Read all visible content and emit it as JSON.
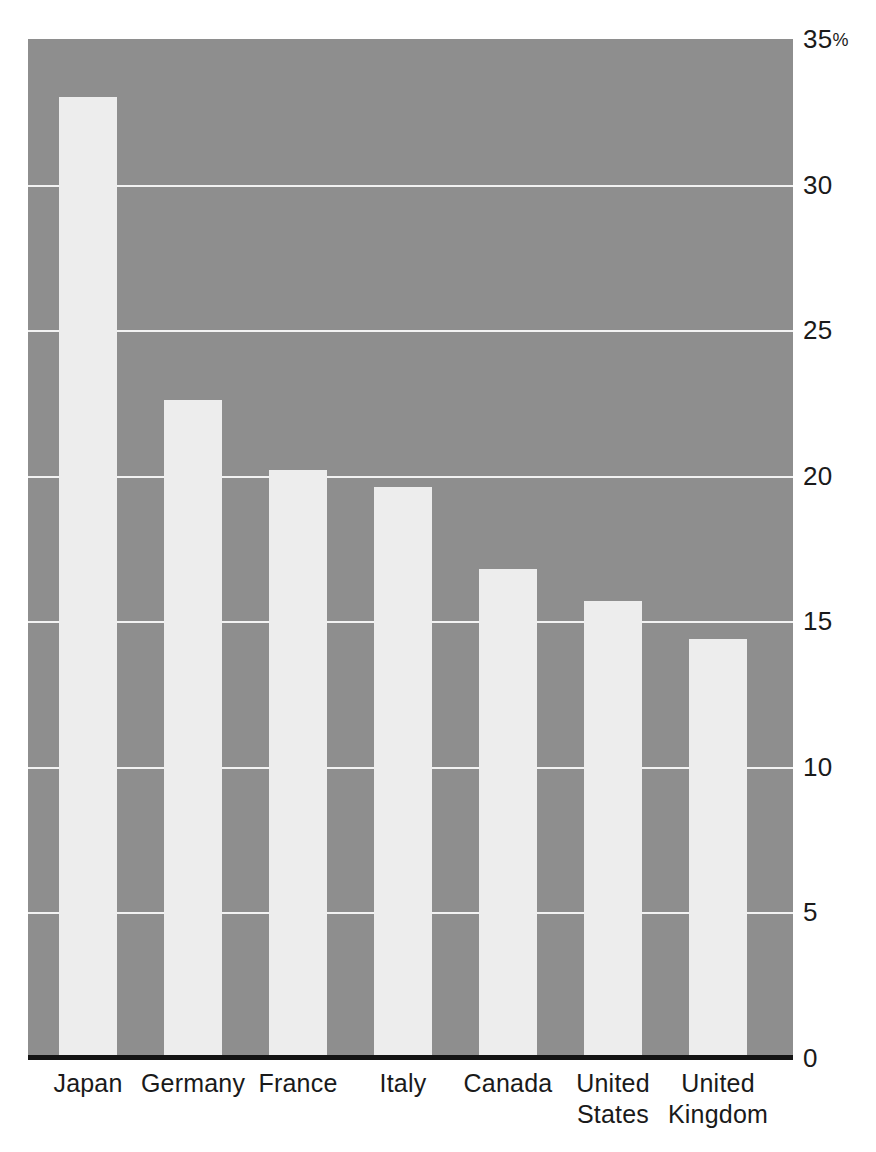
{
  "chart_data": {
    "type": "bar",
    "title": "",
    "subtitle": "",
    "xlabel": "",
    "ylabel": "",
    "unit": "%",
    "categories": [
      "Japan",
      "Germany",
      "France",
      "Italy",
      "Canada",
      "United States",
      "United Kingdom"
    ],
    "category_lines": [
      [
        "Japan"
      ],
      [
        "Germany"
      ],
      [
        "France"
      ],
      [
        "Italy"
      ],
      [
        "Canada"
      ],
      [
        "United",
        "States"
      ],
      [
        "United",
        "Kingdom"
      ]
    ],
    "values": [
      33.0,
      22.6,
      20.2,
      19.6,
      16.8,
      15.7,
      14.4
    ],
    "ylim": [
      0,
      35
    ],
    "yticks": [
      0,
      5,
      10,
      15,
      20,
      25,
      30,
      35
    ],
    "ytick_labels": [
      "0",
      "5",
      "10",
      "15",
      "20",
      "25",
      "30",
      "35%"
    ],
    "gridlines": [
      5,
      10,
      15,
      20,
      25,
      30
    ],
    "grid": true,
    "legend": false,
    "legend_position": "none",
    "axis_side": "right",
    "colors": {
      "plot_background": "#8e8e8e",
      "bar_fill": "#ededed",
      "gridline": "#f2f2f2",
      "axis_line": "#141414",
      "text": "#1a1a1a",
      "page_background": "#ffffff"
    }
  }
}
